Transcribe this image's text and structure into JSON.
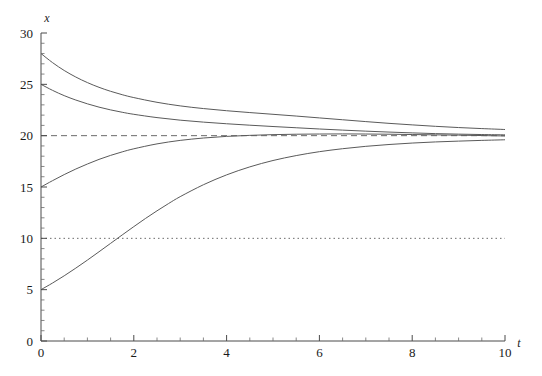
{
  "chart_data": {
    "type": "line",
    "title": "",
    "subtitle": "",
    "xlabel": "t",
    "ylabel": "x",
    "xlim": [
      0,
      10
    ],
    "ylim": [
      0,
      30
    ],
    "grid": false,
    "legend": "none",
    "x_ticks_major": [
      0,
      2,
      4,
      6,
      8,
      10
    ],
    "x_ticks_major_labels": [
      "0",
      "2",
      "4",
      "6",
      "8",
      "10"
    ],
    "x_tick_minor_step": 0.5,
    "y_ticks_major": [
      0,
      5,
      10,
      15,
      20,
      25,
      30
    ],
    "y_ticks_major_labels": [
      "0",
      "5",
      "10",
      "15",
      "20",
      "25",
      "30"
    ],
    "y_tick_minor_step": 1,
    "annotations": [
      {
        "name": "carrying-capacity-line",
        "y": 20,
        "style": "dashed",
        "label": ""
      },
      {
        "name": "inflection-line",
        "y": 10,
        "style": "dotted",
        "label": ""
      }
    ],
    "model": {
      "name": "logistic-growth",
      "carrying_capacity": 20,
      "growth_rate": 0.7
    },
    "series": [
      {
        "name": "x0-28",
        "initial_value": 28,
        "style": "solid",
        "x": [
          0,
          0.25,
          0.5,
          0.75,
          1,
          1.25,
          1.5,
          1.75,
          2,
          2.5,
          3,
          3.5,
          4,
          4.5,
          5,
          5.5,
          6,
          6.5,
          7,
          7.5,
          8,
          8.5,
          9,
          9.5,
          10
        ],
        "values": [
          28,
          27.11,
          26.35,
          25.71,
          25.17,
          24.71,
          24.32,
          23.99,
          23.71,
          23.25,
          22.9,
          22.64,
          22.43,
          22.25,
          22.08,
          21.91,
          21.73,
          21.55,
          21.37,
          21.2,
          21.05,
          20.91,
          20.79,
          20.69,
          20.6
        ]
      },
      {
        "name": "x0-25",
        "initial_value": 25,
        "style": "solid",
        "x": [
          0,
          0.25,
          0.5,
          0.75,
          1,
          1.25,
          1.5,
          1.75,
          2,
          2.5,
          3,
          3.5,
          4,
          4.5,
          5,
          5.5,
          6,
          6.5,
          7,
          7.5,
          8,
          8.5,
          9,
          9.5,
          10
        ],
        "values": [
          25,
          24.41,
          23.9,
          23.47,
          23.1,
          22.78,
          22.51,
          22.28,
          22.08,
          21.76,
          21.51,
          21.32,
          21.16,
          21.02,
          20.89,
          20.77,
          20.65,
          20.54,
          20.44,
          20.35,
          20.27,
          20.2,
          20.15,
          20.11,
          20.08
        ]
      },
      {
        "name": "x0-15",
        "initial_value": 15,
        "style": "solid",
        "x": [
          0,
          0.25,
          0.5,
          0.75,
          1,
          1.25,
          1.5,
          1.75,
          2,
          2.5,
          3,
          3.5,
          4,
          4.5,
          5,
          5.5,
          6,
          6.5,
          7,
          7.5,
          8,
          8.5,
          9,
          9.5,
          10
        ],
        "values": [
          15,
          15.62,
          16.21,
          16.75,
          17.24,
          17.69,
          18.08,
          18.42,
          18.72,
          19.2,
          19.54,
          19.77,
          19.93,
          20.03,
          20.1,
          20.14,
          20.16,
          20.17,
          20.16,
          20.14,
          20.11,
          20.08,
          20.05,
          20.01,
          19.97
        ]
      },
      {
        "name": "x0-5",
        "initial_value": 5,
        "style": "solid",
        "x": [
          0,
          0.25,
          0.5,
          0.75,
          1,
          1.25,
          1.5,
          1.75,
          2,
          2.25,
          2.5,
          2.75,
          3,
          3.5,
          4,
          4.5,
          5,
          5.5,
          6,
          6.5,
          7,
          7.5,
          8,
          8.5,
          9,
          9.5,
          10
        ],
        "values": [
          5,
          5.65,
          6.35,
          7.1,
          7.88,
          8.69,
          9.51,
          10.33,
          11.14,
          11.93,
          12.68,
          13.39,
          14.06,
          15.22,
          16.18,
          16.96,
          17.58,
          18.06,
          18.44,
          18.73,
          18.96,
          19.14,
          19.28,
          19.39,
          19.47,
          19.54,
          19.6
        ]
      }
    ]
  },
  "figure": {
    "background_color": "#ffffff",
    "axis_color": "#4a4a4a",
    "curve_color": "#5a5a5a",
    "refline_color": "#6a6a6a",
    "text_color": "#1a1a1a"
  }
}
